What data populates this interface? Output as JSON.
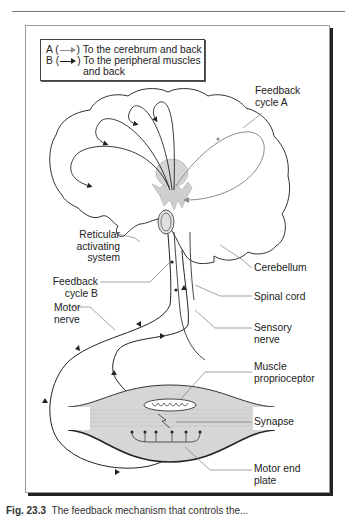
{
  "figure": {
    "legend": {
      "a": {
        "key": "A (",
        "close": ")",
        "text": "To the cerebrum and back",
        "arrow_color": "#8a8a8a"
      },
      "b": {
        "key": "B (",
        "close": ")",
        "text_line1": "To the peripheral muscles",
        "text_line2": "and back",
        "arrow_color": "#222222"
      }
    },
    "labels": {
      "feedback_cycle_a_1": "Feedback",
      "feedback_cycle_a_2": "cycle A",
      "reticular_1": "Reticular",
      "reticular_2": "activating",
      "reticular_3": "system",
      "feedback_cycle_b_1": "Feedback",
      "feedback_cycle_b_2": "cycle B",
      "motor_nerve_1": "Motor",
      "motor_nerve_2": "nerve",
      "cerebellum": "Cerebellum",
      "spinal_cord": "Spinal cord",
      "sensory_nerve_1": "Sensory",
      "sensory_nerve_2": "nerve",
      "muscle_proprioceptor_1": "Muscle",
      "muscle_proprioceptor_2": "proprioceptor",
      "synapse": "Synapse",
      "motor_end_plate_1": "Motor end",
      "motor_end_plate_2": "plate"
    },
    "caption": {
      "number": "Fig. 23.3",
      "text": "The feedback mechanism that controls the..."
    },
    "colors": {
      "cycle_a": "#8a8a8a",
      "cycle_b": "#222222",
      "shading": "#d4d4d4",
      "outline": "#333333"
    }
  }
}
